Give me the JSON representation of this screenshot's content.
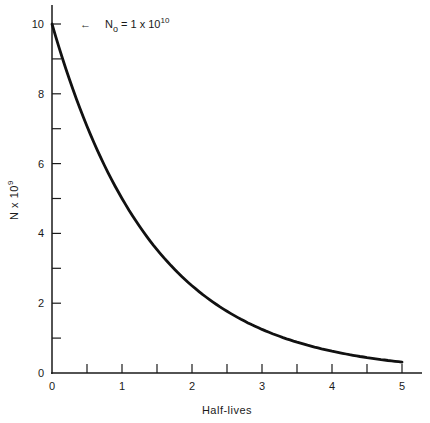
{
  "chart_data": {
    "type": "line",
    "title": "",
    "xlabel": "Half-lives",
    "ylabel": "N x 10^9",
    "ylabel_parts": {
      "base": "N x 10",
      "exp": "9"
    },
    "xlim": [
      0,
      5.2
    ],
    "ylim": [
      0,
      10.5
    ],
    "grid": false,
    "legend": "none",
    "x_ticks_major": [
      0,
      1,
      2,
      3,
      4,
      5
    ],
    "x_ticks_minor": [
      0.5,
      1.5,
      2.5,
      3.5,
      4.5
    ],
    "y_ticks_major": [
      0,
      2,
      4,
      6,
      8,
      10
    ],
    "y_ticks_minor": [
      1,
      3,
      5,
      7,
      9
    ],
    "annotation": {
      "arrow": "←",
      "text_base": "N",
      "text_sub": "o",
      "text_mid": " = 1 x 10",
      "text_exp": "10"
    },
    "series": [
      {
        "name": "N(t) = N0 * (1/2)^t",
        "x": [
          0,
          0.5,
          1,
          1.5,
          2,
          2.5,
          3,
          3.5,
          4,
          4.5,
          5
        ],
        "values": [
          10,
          7.07,
          5,
          3.54,
          2.5,
          1.77,
          1.25,
          0.88,
          0.625,
          0.44,
          0.3125
        ]
      }
    ]
  }
}
